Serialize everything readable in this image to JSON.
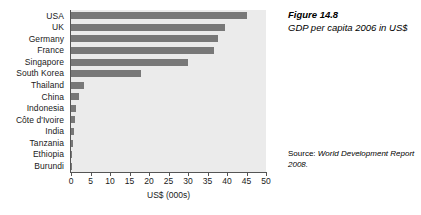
{
  "figure": {
    "number_label": "Figure 14.8",
    "caption": "GDP per capita 2006 in US$",
    "source_lead": "Source: ",
    "source_body": "World Development Report 2008."
  },
  "axis": {
    "x_title": "US$ (000s)",
    "tick_labels": [
      "0",
      "5",
      "10",
      "15",
      "20",
      "25",
      "30",
      "35",
      "40",
      "45",
      "50"
    ]
  },
  "colors": {
    "bar": "#787878",
    "plot_background": "#ebebeb",
    "axis": "#555555",
    "text": "#1a1a1a",
    "page_background": "#ffffff"
  },
  "chart_data": {
    "type": "bar",
    "orientation": "horizontal",
    "title": "Figure 14.8",
    "subtitle": "GDP per capita 2006 in US$",
    "xlabel": "US$ (000s)",
    "ylabel": "",
    "xlim": [
      0,
      50
    ],
    "xticks": [
      0,
      5,
      10,
      15,
      20,
      25,
      30,
      35,
      40,
      45,
      50
    ],
    "grid": false,
    "legend": "none",
    "source": "Source: World Development Report 2008.",
    "categories": [
      "USA",
      "UK",
      "Germany",
      "France",
      "Singapore",
      "South Korea",
      "Thailand",
      "China",
      "Indonesia",
      "Côte d'Ivoire",
      "India",
      "Tanzania",
      "Ethiopia",
      "Burundi"
    ],
    "values": [
      45.0,
      39.5,
      37.7,
      36.7,
      30.0,
      18.0,
      3.4,
      2.0,
      1.4,
      0.9,
      0.8,
      0.4,
      0.2,
      0.1
    ],
    "units": "US$ thousands per capita",
    "year": 2006
  }
}
